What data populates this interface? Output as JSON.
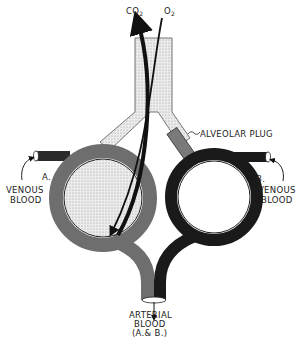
{
  "diagram": {
    "gases": {
      "co2": "CO",
      "co2_sub": "2",
      "o2": "O",
      "o2_sub": "2"
    },
    "labels": {
      "alveolar_plug": "ALVEOLAR PLUG",
      "alveolus_a": "A.",
      "alveolus_b": "B.",
      "venous_blood_left_line1": "VENOUS",
      "venous_blood_left_line2": "BLOOD",
      "venous_blood_right_line1": "VENOUS",
      "venous_blood_right_line2": "BLOOD",
      "arterial_line1": "ARTERIAL",
      "arterial_line2": "BLOOD",
      "arterial_line3": "(A.& B.)"
    },
    "colors": {
      "capillary_a": "#6e6e6e",
      "capillary_b": "#1a1a1a",
      "air_stipple": "#e2e2e2",
      "plug": "#7a7a7a",
      "arrow": "#111111"
    }
  }
}
